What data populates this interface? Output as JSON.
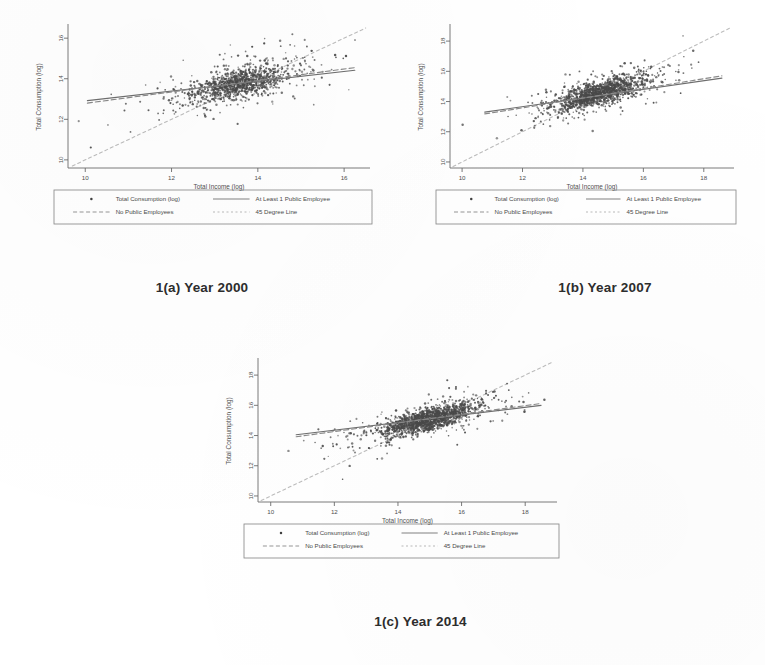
{
  "figure": {
    "panels": [
      {
        "id": "a",
        "caption": "1(a) Year 2000",
        "chart_data": {
          "type": "scatter",
          "title": "",
          "xlabel": "Total Income (log)",
          "ylabel": "Total Consumption (log)",
          "xlim": [
            9.6,
            16.6
          ],
          "ylim": [
            9.6,
            16.6
          ],
          "xticks": [
            "10",
            "12",
            "14",
            "16"
          ],
          "xtick_values": [
            10,
            12,
            14,
            16
          ],
          "yticks": [
            "10",
            "12",
            "14",
            "16"
          ],
          "ytick_values": [
            10,
            12,
            14,
            16
          ],
          "grid": false,
          "legend_position": "below-axes",
          "point_count": 1100,
          "cloud": {
            "x_mean": 13.55,
            "y_mean": 13.75,
            "x_sd": 0.78,
            "y_sd": 0.62,
            "correlation": 0.62
          },
          "series": [
            {
              "name": "Total Consumption (log)",
              "marker": "dot",
              "color": "#4a4a4a"
            },
            {
              "name": "At Least 1 Public Employee",
              "type": "fitline",
              "color": "#6e6e6e",
              "x": [
                10.05,
                16.25
              ],
              "y": [
                12.92,
                14.42
              ]
            },
            {
              "name": "No Public Employees",
              "type": "fitline",
              "color": "#8a8a8a",
              "x": [
                10.05,
                16.25
              ],
              "y": [
                12.8,
                14.55
              ]
            },
            {
              "name": "45 Degree Line",
              "type": "reference",
              "color": "#bdbdbd",
              "x": [
                9.7,
                16.5
              ],
              "y": [
                9.7,
                16.5
              ]
            }
          ]
        }
      },
      {
        "id": "b",
        "caption": "1(b) Year 2007",
        "chart_data": {
          "type": "scatter",
          "title": "",
          "xlabel": "Total Income (log)",
          "ylabel": "Total Consumption (log)",
          "xlim": [
            9.6,
            19.0
          ],
          "ylim": [
            9.6,
            19.0
          ],
          "xticks": [
            "10",
            "12",
            "14",
            "16",
            "18"
          ],
          "xtick_values": [
            10,
            12,
            14,
            16,
            18
          ],
          "yticks": [
            "10",
            "12",
            "14",
            "16",
            "18"
          ],
          "ytick_values": [
            10,
            12,
            14,
            16,
            18
          ],
          "grid": false,
          "legend_position": "below-axes",
          "point_count": 1400,
          "cloud": {
            "x_mean": 14.55,
            "y_mean": 14.55,
            "x_sd": 0.95,
            "y_sd": 0.72,
            "correlation": 0.72
          },
          "series": [
            {
              "name": "Total Consumption (log)",
              "marker": "dot",
              "color": "#4a4a4a"
            },
            {
              "name": "At Least 1 Public Employee",
              "type": "fitline",
              "color": "#6e6e6e",
              "x": [
                10.75,
                18.6
              ],
              "y": [
                13.3,
                15.55
              ]
            },
            {
              "name": "No Public Employees",
              "type": "fitline",
              "color": "#8a8a8a",
              "x": [
                10.75,
                18.6
              ],
              "y": [
                13.18,
                15.7
              ]
            },
            {
              "name": "45 Degree Line",
              "type": "reference",
              "color": "#bdbdbd",
              "x": [
                9.7,
                18.9
              ],
              "y": [
                9.7,
                18.9
              ]
            }
          ]
        }
      },
      {
        "id": "c",
        "caption": "1(c) Year 2014",
        "chart_data": {
          "type": "scatter",
          "title": "",
          "xlabel": "Total Income (log)",
          "ylabel": "Total Consumption (log)",
          "xlim": [
            9.6,
            19.0
          ],
          "ylim": [
            9.6,
            19.0
          ],
          "xticks": [
            "10",
            "12",
            "14",
            "16",
            "18"
          ],
          "xtick_values": [
            10,
            12,
            14,
            16,
            18
          ],
          "yticks": [
            "10",
            "12",
            "14",
            "16",
            "18"
          ],
          "ytick_values": [
            10,
            12,
            14,
            16,
            18
          ],
          "grid": false,
          "legend_position": "below-axes",
          "point_count": 1500,
          "cloud": {
            "x_mean": 14.95,
            "y_mean": 15.05,
            "x_sd": 1.0,
            "y_sd": 0.72,
            "correlation": 0.74
          },
          "series": [
            {
              "name": "Total Consumption (log)",
              "marker": "dot",
              "color": "#4a4a4a"
            },
            {
              "name": "At Least 1 Public Employee",
              "type": "fitline",
              "color": "#6e6e6e",
              "x": [
                10.8,
                18.5
              ],
              "y": [
                14.05,
                16.0
              ]
            },
            {
              "name": "No Public Employees",
              "type": "fitline",
              "color": "#8a8a8a",
              "x": [
                10.8,
                18.5
              ],
              "y": [
                13.92,
                16.12
              ]
            },
            {
              "name": "45 Degree Line",
              "type": "reference",
              "color": "#bdbdbd",
              "x": [
                9.7,
                18.9
              ],
              "y": [
                9.7,
                18.9
              ]
            }
          ]
        }
      }
    ],
    "legend": {
      "entries": [
        {
          "label": "Total Consumption (log)",
          "glyph": "dot",
          "color": "#3f3f3f"
        },
        {
          "label": "At Least 1 Public Employee",
          "glyph": "line",
          "color": "#7a7a7a"
        },
        {
          "label": "No Public Employees",
          "glyph": "dashline",
          "color": "#8f8f8f"
        },
        {
          "label": "45 Degree Line",
          "glyph": "dotline",
          "color": "#b5b5b5"
        }
      ]
    },
    "colors": {
      "background": "#ffffff",
      "ink": "#3a3a3a",
      "point": "#4a4a4a",
      "axis": "#6b6b6b",
      "fortyfive": "#bdbdbd"
    }
  }
}
